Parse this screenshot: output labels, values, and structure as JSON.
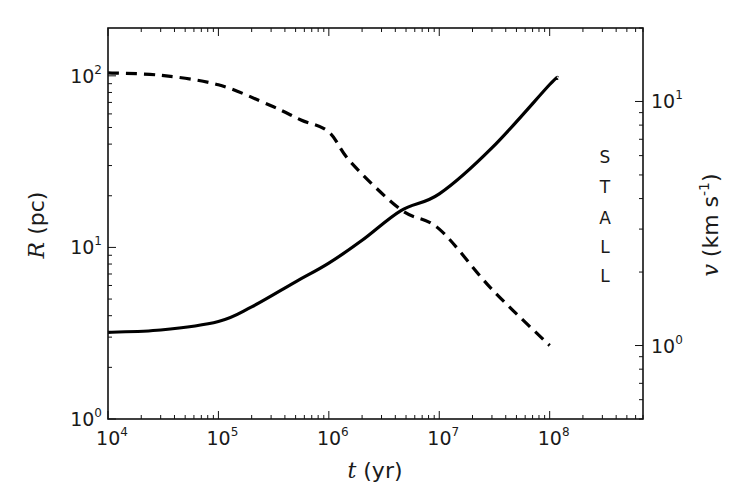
{
  "chart_data": {
    "type": "line",
    "title": "",
    "xlabel": {
      "var": "t",
      "unit": " (yr)"
    },
    "ylabel_left": {
      "var": "R",
      "unit": " (pc)"
    },
    "ylabel_right": {
      "var": "v",
      "unit": " (km s",
      "sup": "-1",
      "close": ")"
    },
    "xscale": "log",
    "yscale_left": "log",
    "yscale_right": "log",
    "xlim": [
      10000,
      700000000
    ],
    "ylim_left": [
      1,
      190
    ],
    "ylim_right": [
      0.5,
      20
    ],
    "x_ticks": [
      {
        "base": "10",
        "exp": "4",
        "value": 10000
      },
      {
        "base": "10",
        "exp": "5",
        "value": 100000
      },
      {
        "base": "10",
        "exp": "6",
        "value": 1000000
      },
      {
        "base": "10",
        "exp": "7",
        "value": 10000000
      },
      {
        "base": "10",
        "exp": "8",
        "value": 100000000
      }
    ],
    "y_left_ticks": [
      {
        "base": "10",
        "exp": "0",
        "value": 1
      },
      {
        "base": "10",
        "exp": "1",
        "value": 10
      },
      {
        "base": "10",
        "exp": "2",
        "value": 100
      }
    ],
    "y_right_ticks": [
      {
        "base": "10",
        "exp": "0",
        "value": 1
      },
      {
        "base": "10",
        "exp": "1",
        "value": 10
      }
    ],
    "series": [
      {
        "name": "R (radius)",
        "axis": "left",
        "style": "solid",
        "color": "#000000",
        "x": [
          10000,
          30000,
          100000,
          200000,
          500000,
          1000000,
          2000000,
          4500000,
          10000000,
          30000000,
          100000000,
          118000000
        ],
        "y": [
          3.2,
          3.3,
          3.7,
          4.5,
          6.3,
          8.1,
          11.0,
          16.4,
          20.5,
          38.0,
          89.0,
          97.0
        ]
      },
      {
        "name": "v (velocity)",
        "axis": "right",
        "style": "dashed",
        "color": "#000000",
        "x": [
          10000,
          30000,
          100000,
          300000,
          560000,
          1000000,
          1600000,
          4500000,
          10000000,
          30000000,
          100000000
        ],
        "y": [
          13.1,
          12.8,
          11.7,
          9.6,
          8.4,
          7.5,
          5.6,
          3.6,
          3.0,
          1.7,
          1.0
        ]
      }
    ],
    "annotations": [
      {
        "text": "S",
        "x_px": 605,
        "y_px": 157
      },
      {
        "text": "T",
        "x_px": 605,
        "y_px": 187
      },
      {
        "text": "A",
        "x_px": 605,
        "y_px": 218
      },
      {
        "text": "L",
        "x_px": 605,
        "y_px": 247
      },
      {
        "text": "L",
        "x_px": 605,
        "y_px": 276
      }
    ],
    "grid": false,
    "legend": null
  }
}
